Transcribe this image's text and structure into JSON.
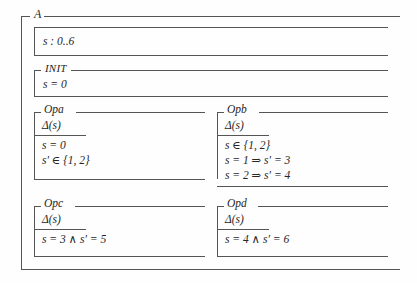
{
  "document": {
    "kind": "z-notation-specification",
    "background_color": "#fefefe",
    "line_color": "#555555",
    "text_color": "#262626"
  },
  "outer_schema": {
    "name": "A",
    "declaration_box": {
      "lines": [
        {
          "text": "s : 0..6"
        }
      ]
    }
  },
  "schemas": [
    {
      "id": "init",
      "name": "INIT",
      "name_style": "small-caps-italic",
      "declarations": [],
      "predicates": [
        {
          "text": "s = 0"
        }
      ]
    },
    {
      "id": "opa",
      "name": "Opa",
      "name_style": "italic",
      "declarations": [
        {
          "text": "Δ(s)"
        }
      ],
      "predicates": [
        {
          "text": "s = 0"
        },
        {
          "text": "s′ ∈ {1, 2}"
        }
      ]
    },
    {
      "id": "opb",
      "name": "Opb",
      "name_style": "italic",
      "declarations": [
        {
          "text": "Δ(s)"
        }
      ],
      "predicates": [
        {
          "text": "s ∈ {1, 2}"
        },
        {
          "text": "s = 1 ⇒ s′ = 3"
        },
        {
          "text": "s = 2 ⇒ s′ = 4"
        }
      ]
    },
    {
      "id": "opc",
      "name": "Opc",
      "name_style": "italic",
      "declarations": [
        {
          "text": "Δ(s)"
        }
      ],
      "predicates": [
        {
          "text": "s = 3 ∧ s′ = 5"
        }
      ]
    },
    {
      "id": "opd",
      "name": "Opd",
      "name_style": "italic",
      "declarations": [
        {
          "text": "Δ(s)"
        }
      ],
      "predicates": [
        {
          "text": "s = 4 ∧ s′ = 6"
        }
      ]
    }
  ]
}
